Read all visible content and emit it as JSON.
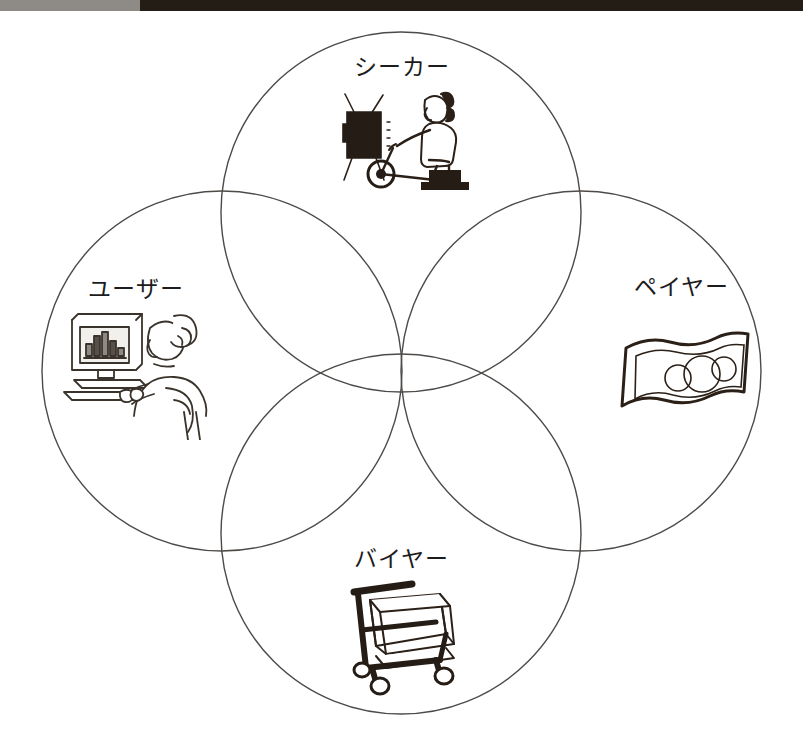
{
  "page": {
    "type": "four-circle-venn-diagram",
    "background_color": "#ffffff",
    "stroke_color": "#4d4a47",
    "text_color": "#1c1c1c"
  },
  "scan_band": {
    "left_color": "#8e8b86",
    "right_color": "#241d16"
  },
  "diagram": {
    "circles": [
      {
        "id": "seeker",
        "cx": 401,
        "cy": 212,
        "r": 180
      },
      {
        "id": "user",
        "cx": 222,
        "cy": 371,
        "r": 180
      },
      {
        "id": "payer",
        "cx": 581,
        "cy": 371,
        "r": 180
      },
      {
        "id": "buyer",
        "cx": 401,
        "cy": 534,
        "r": 180
      }
    ],
    "labels": {
      "seeker": "シーカー",
      "user": "ユーザー",
      "payer": "ペイヤー",
      "buyer": "バイヤー"
    },
    "icons": {
      "seeker": "tv-and-exercise-bike-icon",
      "user": "person-at-computer-with-bar-chart-icon",
      "payer": "banknote-icon",
      "buyer": "shopping-cart-icon"
    }
  }
}
